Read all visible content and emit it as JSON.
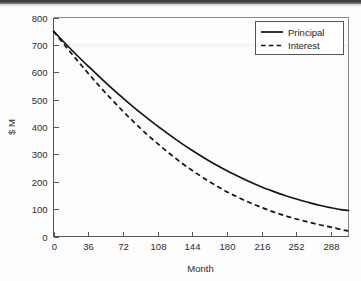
{
  "chart_data": {
    "type": "line",
    "title": "",
    "subtitle": "",
    "xlabel": "Month",
    "ylabel": "$ M",
    "xlim": [
      0,
      306
    ],
    "ylim": [
      0,
      800
    ],
    "xticks": [
      0,
      36,
      72,
      108,
      144,
      180,
      216,
      252,
      288
    ],
    "xtick_labels": [
      "0",
      "36",
      "72",
      "108",
      "144",
      "180",
      "216",
      "252",
      "288"
    ],
    "yticks": [
      0,
      100,
      200,
      300,
      400,
      500,
      600,
      700,
      800
    ],
    "ytick_labels": [
      "0",
      "100",
      "200",
      "300",
      "400",
      "500",
      "600",
      "700",
      "800"
    ],
    "grid": false,
    "legend_position": "top-right-inside",
    "x": [
      0,
      12,
      24,
      36,
      48,
      60,
      72,
      84,
      96,
      108,
      120,
      132,
      144,
      156,
      168,
      180,
      192,
      204,
      216,
      228,
      240,
      252,
      264,
      276,
      288,
      300,
      306
    ],
    "series": [
      {
        "name": "Principal",
        "style": "solid",
        "color": "#141414",
        "values": [
          750,
          706,
          663,
          622,
          582,
          543,
          506,
          470,
          436,
          403,
          372,
          342,
          314,
          288,
          263,
          240,
          219,
          199,
          181,
          165,
          150,
          137,
          125,
          114,
          105,
          97,
          95
        ]
      },
      {
        "name": "Interest",
        "style": "dashed",
        "color": "#141414",
        "values": [
          750,
          697,
          646,
          596,
          548,
          502,
          458,
          416,
          376,
          339,
          304,
          271,
          241,
          213,
          187,
          163,
          142,
          123,
          106,
          90,
          76,
          64,
          53,
          43,
          34,
          24,
          20
        ]
      }
    ],
    "legend": [
      {
        "label": "Principal",
        "style": "solid"
      },
      {
        "label": "Interest",
        "style": "dashed"
      }
    ]
  }
}
